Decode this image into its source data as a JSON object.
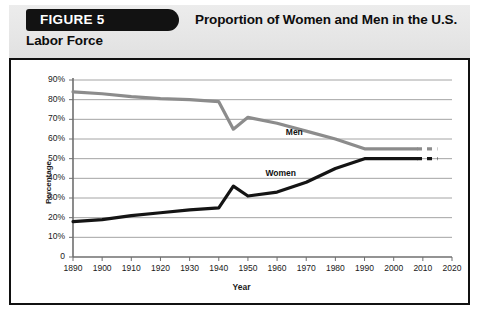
{
  "header": {
    "badge_label": "FIGURE 5",
    "title_line1": "Proportion of Women and Men in the U.S.",
    "title_line2": "Labor Force"
  },
  "colors": {
    "men_line": "#8c8c8c",
    "women_line": "#141414",
    "gridline": "#9a9a9a",
    "axis": "#6f6f6f",
    "badge_bg": "#121212",
    "header_bg": "#e9e9e9",
    "frame_border": "#111111"
  },
  "chart_data": {
    "type": "line",
    "title": "Proportion of Women and Men in the U.S. Labor Force",
    "xlabel": "Year",
    "ylabel": "Percentage",
    "xlim": [
      1890,
      2020
    ],
    "ylim": [
      0,
      90
    ],
    "grid": "horizontal",
    "legend": "inline-labels",
    "ytick_labels": [
      "90%",
      "80%",
      "70%",
      "60%",
      "50%",
      "40%",
      "30%",
      "20%",
      "10%",
      "0"
    ],
    "ytick_values": [
      90,
      80,
      70,
      60,
      50,
      40,
      30,
      20,
      10,
      0
    ],
    "xtick_labels": [
      "1890",
      "1900",
      "1910",
      "1920",
      "1930",
      "1940",
      "1950",
      "1960",
      "1970",
      "1980",
      "1990",
      "2000",
      "2010",
      "2020"
    ],
    "xtick_values": [
      1890,
      1900,
      1910,
      1920,
      1930,
      1940,
      1950,
      1960,
      1970,
      1980,
      1990,
      2000,
      2010,
      2020
    ],
    "series": [
      {
        "name": "Men",
        "color": "#8c8c8c",
        "label_x": 1963,
        "label_y": 63,
        "x": [
          1890,
          1900,
          1910,
          1920,
          1930,
          1940,
          1945,
          1950,
          1960,
          1970,
          1980,
          1990,
          2000,
          2008
        ],
        "values": [
          84,
          83,
          81.5,
          80.5,
          80,
          79,
          65,
          71,
          68,
          64,
          60,
          55,
          55,
          55
        ],
        "projection": {
          "x": [
            2008,
            2015
          ],
          "values": [
            55,
            55
          ],
          "style": "dashed"
        }
      },
      {
        "name": "Women",
        "color": "#141414",
        "label_x": 1956,
        "label_y": 42,
        "x": [
          1890,
          1900,
          1910,
          1920,
          1930,
          1940,
          1945,
          1950,
          1960,
          1970,
          1980,
          1990,
          2000,
          2008
        ],
        "values": [
          18,
          19,
          21,
          22.5,
          24,
          25,
          36,
          31,
          33,
          38,
          45,
          50,
          50,
          50
        ],
        "projection": {
          "x": [
            2008,
            2015
          ],
          "values": [
            50,
            50
          ],
          "style": "dashed"
        }
      }
    ]
  }
}
